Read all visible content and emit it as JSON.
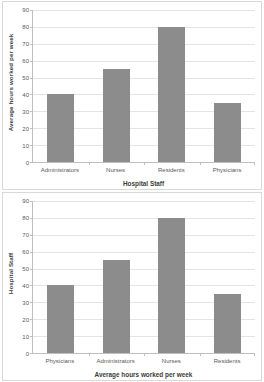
{
  "document": {
    "kind": "two-stacked-bar-charts"
  },
  "chart_data": [
    {
      "id": "top",
      "type": "bar",
      "title": "",
      "categories": [
        "Administrators",
        "Nurses",
        "Residents",
        "Physicians"
      ],
      "values": [
        40,
        55,
        80,
        35
      ],
      "xlabel": "Hospital Staff",
      "ylabel": "Average hours worked per week",
      "ylim": [
        0,
        90
      ],
      "ytick_step": 10,
      "yticks": [
        90,
        80,
        70,
        60,
        50,
        40,
        30,
        20,
        10,
        0
      ],
      "grid": true,
      "legend": "none",
      "bar_color": "#8c8c8c"
    },
    {
      "id": "bottom",
      "type": "bar",
      "title": "",
      "categories": [
        "Physicians",
        "Administrators",
        "Nurses",
        "Residents"
      ],
      "values": [
        40,
        55,
        80,
        35
      ],
      "xlabel": "Average hours worked per week",
      "ylabel": "Hospital Staff",
      "ylim": [
        0,
        90
      ],
      "ytick_step": 10,
      "yticks": [
        90,
        80,
        70,
        60,
        50,
        40,
        30,
        20,
        10,
        0
      ],
      "grid": true,
      "legend": "none",
      "bar_color": "#8c8c8c"
    }
  ]
}
